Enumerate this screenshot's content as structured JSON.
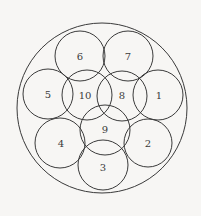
{
  "diagram": {
    "type": "circle-packing",
    "background": "#f7f6f4",
    "stroke_color": "#3a3a3a",
    "outer_circle": {
      "cx": 102,
      "cy": 108,
      "r": 85
    },
    "circles": [
      {
        "id": "1",
        "label": "1",
        "cx": 158,
        "cy": 95,
        "r": 25
      },
      {
        "id": "2",
        "label": "2",
        "cx": 148,
        "cy": 143,
        "r": 24
      },
      {
        "id": "3",
        "label": "3",
        "cx": 103,
        "cy": 165,
        "r": 25
      },
      {
        "id": "4",
        "label": "4",
        "cx": 60,
        "cy": 143,
        "r": 25
      },
      {
        "id": "5",
        "label": "5",
        "cx": 48,
        "cy": 94,
        "r": 25
      },
      {
        "id": "6",
        "label": "6",
        "cx": 80,
        "cy": 56,
        "r": 25
      },
      {
        "id": "7",
        "label": "7",
        "cx": 128,
        "cy": 56,
        "r": 25
      },
      {
        "id": "8",
        "label": "8",
        "cx": 122,
        "cy": 96,
        "r": 25
      },
      {
        "id": "9",
        "label": "9",
        "cx": 105,
        "cy": 130,
        "r": 25
      },
      {
        "id": "10",
        "label": "10",
        "cx": 87,
        "cy": 95,
        "r": 25
      }
    ],
    "labels": [
      {
        "text": "1",
        "x": 159,
        "y": 96
      },
      {
        "text": "2",
        "x": 148,
        "y": 144
      },
      {
        "text": "3",
        "x": 103,
        "y": 168
      },
      {
        "text": "4",
        "x": 61,
        "y": 144
      },
      {
        "text": "5",
        "x": 48,
        "y": 95
      },
      {
        "text": "6",
        "x": 80,
        "y": 57
      },
      {
        "text": "7",
        "x": 128,
        "y": 57
      },
      {
        "text": "8",
        "x": 122,
        "y": 96
      },
      {
        "text": "9",
        "x": 105,
        "y": 130
      },
      {
        "text": "10",
        "x": 85,
        "y": 96
      }
    ]
  }
}
